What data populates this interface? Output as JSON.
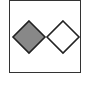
{
  "diagram": {
    "frame": {
      "border_color": "#333333",
      "background": "#ffffff"
    },
    "shapes": [
      {
        "type": "diamond",
        "name": "filled-diamond",
        "fill": "#888888",
        "stroke": "#222222"
      },
      {
        "type": "diamond",
        "name": "outline-diamond",
        "fill": "#ffffff",
        "stroke": "#222222"
      }
    ]
  }
}
